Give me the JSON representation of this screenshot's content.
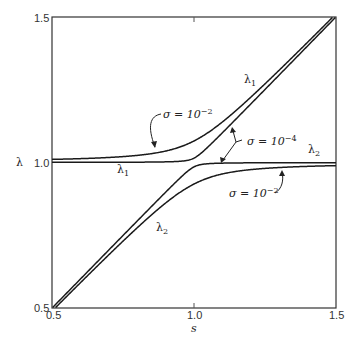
{
  "chart_data": {
    "type": "line",
    "title": "",
    "xlabel": "s",
    "ylabel": "λ",
    "xlim": [
      0.5,
      1.5
    ],
    "ylim": [
      0.5,
      1.5
    ],
    "x_ticks": [
      "0.5",
      "1.0",
      "1.5"
    ],
    "y_ticks": [
      "0.5",
      "1.0",
      "1.5"
    ],
    "grid": false,
    "legend": "none (inline annotations)",
    "series": [
      {
        "name": "λ1, σ = 10^-2",
        "coupling": 0.074,
        "branch": "upper",
        "x": [
          0.5,
          0.6,
          0.7,
          0.8,
          0.9,
          1.0,
          1.1,
          1.2,
          1.3,
          1.4,
          1.5
        ],
        "y": [
          1.011,
          1.014,
          1.02,
          1.029,
          1.046,
          1.074,
          1.113,
          1.171,
          1.239,
          1.315,
          1.396
        ]
      },
      {
        "name": "λ2, σ = 10^-2",
        "coupling": 0.074,
        "branch": "lower",
        "x": [
          0.5,
          0.6,
          0.7,
          0.8,
          0.9,
          1.0,
          1.1,
          1.2,
          1.3,
          1.4,
          1.5
        ],
        "y": [
          0.489,
          0.586,
          0.68,
          0.771,
          0.854,
          0.926,
          0.987,
          1.029,
          1.061,
          1.085,
          0.989
        ]
      },
      {
        "name": "λ1, σ = 10^-4",
        "coupling": 0.015,
        "branch": "upper",
        "x": [
          0.5,
          0.6,
          0.7,
          0.8,
          0.9,
          1.0,
          1.1,
          1.2,
          1.3,
          1.4,
          1.5
        ],
        "y": [
          1.0,
          1.001,
          1.001,
          1.001,
          1.002,
          1.015,
          1.102,
          1.201,
          1.301,
          1.401,
          1.5
        ]
      },
      {
        "name": "λ2, σ = 10^-4",
        "coupling": 0.015,
        "branch": "lower",
        "x": [
          0.5,
          0.6,
          0.7,
          0.8,
          0.9,
          1.0,
          1.1,
          1.2,
          1.3,
          1.4,
          1.5
        ],
        "y": [
          0.5,
          0.599,
          0.699,
          0.799,
          0.898,
          0.985,
          0.998,
          0.999,
          0.999,
          0.999,
          1.0
        ]
      }
    ],
    "annotations": [
      {
        "text_main": "σ = 10",
        "exp": "−2",
        "target": "upper curve σ=10^-2 near s≈0.85"
      },
      {
        "text_main": "σ = 10",
        "exp": "−4",
        "target": "both curves σ=10^-4 near s≈1.05"
      },
      {
        "text_main": "σ = 10",
        "exp": "−2",
        "target": "lower curve σ=10^-2 near s≈1.25"
      },
      {
        "text": "λ1",
        "where": "upper branch label"
      },
      {
        "text": "λ1",
        "where": "flat branch label below 1.0"
      },
      {
        "text": "λ2",
        "where": "flat branch label right"
      },
      {
        "text": "λ2",
        "where": "lower branch label"
      }
    ]
  },
  "axes": {
    "x_tick_left": "0.5",
    "x_tick_mid": "1.0",
    "x_tick_right": "1.5",
    "y_tick_top": "1.5",
    "y_tick_mid": "1.0",
    "y_tick_bottom": "0.5",
    "xlabel": "s",
    "ylabel": "λ"
  },
  "labels": {
    "lambda": "λ",
    "sub1": "1",
    "sub2": "2",
    "sigma_eq": "σ = 10",
    "exp2": "−2",
    "exp4": "−4"
  }
}
